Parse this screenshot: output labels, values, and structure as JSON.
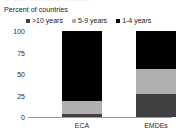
{
  "cut_title": "Figure: Duration of episodes",
  "axis_title": "Percent of countries",
  "legend": {
    "items": [
      {
        "label": ">10 years",
        "color": "#404040",
        "swatch": "square-marker"
      },
      {
        "label": "5-9 years",
        "color": "#b0b0b0",
        "swatch": "square-marker"
      },
      {
        "label": "1-4 years",
        "color": "#000000",
        "swatch": "square-marker"
      }
    ]
  },
  "chart_data": {
    "type": "bar",
    "title": "Percent of countries",
    "xlabel": "",
    "ylabel": "Percent of countries",
    "ylim": [
      0,
      100
    ],
    "yticks": [
      "0",
      "25",
      "50",
      "75",
      "100"
    ],
    "grid": false,
    "stacked": true,
    "legend_position": "top",
    "categories": [
      "ECA",
      "EMDEs"
    ],
    "series": [
      {
        "name": ">10 years",
        "color": "#404040",
        "values": [
          4,
          27
        ]
      },
      {
        "name": "5-9 years",
        "color": "#b0b0b0",
        "values": [
          15,
          29
        ]
      },
      {
        "name": "1-4 years",
        "color": "#000000",
        "values": [
          81,
          44
        ]
      }
    ]
  }
}
